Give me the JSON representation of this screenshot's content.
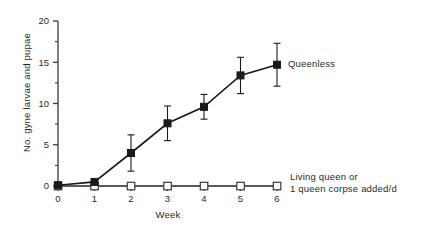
{
  "chart_data": {
    "type": "line",
    "title": "",
    "xlabel": "Week",
    "ylabel": "No. gyne larvae and pupae",
    "x": [
      0,
      1,
      2,
      3,
      4,
      5,
      6
    ],
    "xlim": [
      0,
      6
    ],
    "ylim": [
      0,
      20
    ],
    "xticks": [
      "0",
      "1",
      "2",
      "3",
      "4",
      "5",
      "6"
    ],
    "yticks": [
      "0",
      "5",
      "10",
      "15",
      "20"
    ],
    "y_minor_step": 2.5,
    "grid": false,
    "legend_position": "inline-right",
    "series": [
      {
        "name": "Queenless",
        "marker": "filled-square",
        "values": [
          0.1,
          0.5,
          4.0,
          7.6,
          9.6,
          13.4,
          14.7
        ],
        "errors": [
          0.0,
          0.3,
          2.2,
          2.1,
          1.5,
          2.2,
          2.6
        ]
      },
      {
        "name": "Living queen or 1 queen corpse added/d",
        "marker": "open-square",
        "values": [
          0,
          0,
          0,
          0,
          0,
          0,
          0
        ],
        "errors": [
          0,
          0,
          0,
          0,
          0,
          0,
          0
        ]
      }
    ],
    "annotations": [
      {
        "text": "Queenless",
        "x": 6,
        "y": 14.7
      },
      {
        "text": "Living queen or",
        "x": 6,
        "y": 0
      },
      {
        "text": "1 queen corpse added/d",
        "x": 6,
        "y": 0
      }
    ]
  },
  "labels": {
    "queenless": "Queenless",
    "queenright_line1": "Living queen or",
    "queenright_line2": "1 queen corpse added/d",
    "axis_x": "Week",
    "axis_y": "No. gyne larvae and pupae"
  }
}
